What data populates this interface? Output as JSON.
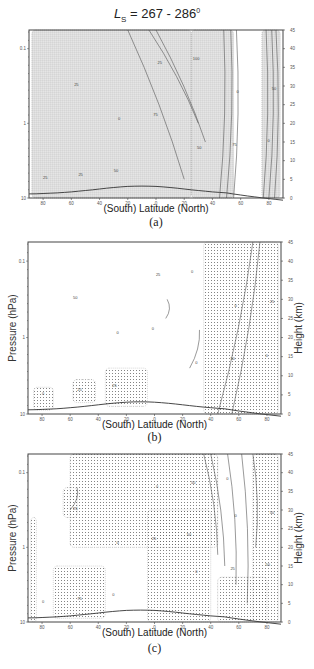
{
  "figure": {
    "title_prefix": "L",
    "title_sub": "S",
    "title_range": " = 267 - 286",
    "title_sup": "0"
  },
  "chart_data": [
    {
      "type": "heatmap",
      "panel": "(a)",
      "title": "L_S = 267 - 286°",
      "xlabel": "(South)   Latitude  (North)",
      "ylabel_left": "",
      "ylabel_right": "",
      "x_ticks": [
        "80",
        "60",
        "40",
        "20",
        "0",
        "20",
        "40",
        "60",
        "80"
      ],
      "x_range": [
        -90,
        90
      ],
      "y_ticks_left_pressure": [
        "0.1",
        "1",
        "10"
      ],
      "y_ticks_right_height_km": [
        "45",
        "40",
        "35",
        "30",
        "25",
        "20",
        "15",
        "10",
        "5",
        "0"
      ],
      "y_range_km": [
        0,
        45
      ],
      "description": "Latitude-height contour field; stippling covers most of the domain; dense contour packing at ~45-55N and ~75-85N from surface to 45 km",
      "contour_labels": [
        "25",
        "0",
        "50",
        "25",
        "0",
        "25",
        "50",
        "75",
        "100",
        "75",
        "50",
        "25",
        "0"
      ],
      "stippled_regions": [
        {
          "lat_range": [
            -88,
            25
          ],
          "height_km": [
            0,
            45
          ]
        },
        {
          "lat_range": [
            25,
            55
          ],
          "height_km": [
            0,
            45
          ]
        },
        {
          "lat_range": [
            75,
            88
          ],
          "height_km": [
            0,
            45
          ]
        }
      ]
    },
    {
      "type": "heatmap",
      "panel": "(b)",
      "xlabel": "(South)   Latitude  (North)",
      "ylabel_left": "Pressure (hPa)",
      "ylabel_right": "Height (km)",
      "x_ticks": [
        "80",
        "60",
        "40",
        "20",
        "0",
        "20",
        "40",
        "60",
        "80"
      ],
      "x_range": [
        -90,
        90
      ],
      "y_ticks_left_pressure": [
        "0.1",
        "1",
        "10"
      ],
      "y_ticks_right_height_km": [
        "45",
        "40",
        "35",
        "30",
        "25",
        "20",
        "15",
        "10",
        "5",
        "0"
      ],
      "y_range_km": [
        0,
        45
      ],
      "description": "Mostly unstippled; stippled tongue rising from ~40-85N near surface to 45 km at 60-80N; small stippled patches near surface in southern hemisphere",
      "contour_labels": [
        "0",
        "0",
        "0",
        "25",
        "0",
        "25",
        "25",
        "50",
        "0",
        "0",
        "25",
        "50",
        "0"
      ],
      "stippled_regions": [
        {
          "lat_range": [
            -86,
            -72
          ],
          "height_km": [
            1,
            7
          ]
        },
        {
          "lat_range": [
            -58,
            -42
          ],
          "height_km": [
            3,
            9
          ]
        },
        {
          "lat_range": [
            -35,
            -5
          ],
          "height_km": [
            2,
            12
          ]
        },
        {
          "lat_range": [
            35,
            88
          ],
          "height_km": [
            0,
            45
          ]
        }
      ]
    },
    {
      "type": "heatmap",
      "panel": "(c)",
      "xlabel": "(South)   Latitude  (North)",
      "ylabel_left": "Pressure (hPa)",
      "ylabel_right": "Height (km)",
      "x_ticks": [
        "80",
        "60",
        "40",
        "20",
        "0",
        "20",
        "40",
        "60",
        "80"
      ],
      "x_range": [
        -90,
        90
      ],
      "y_ticks_left_pressure": [
        "0.1",
        "1",
        "10"
      ],
      "y_ticks_right_height_km": [
        "45",
        "40",
        "35",
        "30",
        "25",
        "20",
        "15",
        "10",
        "5",
        "0"
      ],
      "y_range_km": [
        0,
        45
      ],
      "description": "Large stippled region over tropics/northern midlatitudes upper levels and northern high latitudes near surface; unstippled jet core ~50-70N",
      "contour_labels": [
        "0",
        "0",
        "0",
        "0",
        "0",
        "75",
        "50",
        "25",
        "50",
        "25",
        "0",
        "25",
        "50",
        "0",
        "50"
      ],
      "stippled_regions": [
        {
          "lat_range": [
            -60,
            45
          ],
          "height_km": [
            20,
            45
          ]
        },
        {
          "lat_range": [
            -5,
            40
          ],
          "height_km": [
            0,
            30
          ]
        },
        {
          "lat_range": [
            -72,
            -35
          ],
          "height_km": [
            1,
            15
          ]
        },
        {
          "lat_range": [
            -65,
            -55
          ],
          "height_km": [
            28,
            36
          ]
        },
        {
          "lat_range": [
            -88,
            -84
          ],
          "height_km": [
            0,
            28
          ]
        },
        {
          "lat_range": [
            70,
            88
          ],
          "height_km": [
            0,
            45
          ]
        },
        {
          "lat_range": [
            45,
            80
          ],
          "height_km": [
            0,
            12
          ]
        }
      ]
    }
  ],
  "panels": {
    "a": {
      "tag": "(a)",
      "xlabel": "(South)   Latitude  (North)"
    },
    "b": {
      "tag": "(b)",
      "xlabel": "(South)   Latitude  (North)",
      "ylabel_left": "Pressure (hPa)",
      "ylabel_right": "Height (km)"
    },
    "c": {
      "tag": "(c)",
      "xlabel": "(South)   Latitude  (North)",
      "ylabel_left": "Pressure (hPa)",
      "ylabel_right": "Height (km)"
    }
  },
  "axes": {
    "x_ticks": [
      "80",
      "60",
      "40",
      "20",
      "0",
      "20",
      "40",
      "60",
      "80"
    ],
    "p_ticks": [
      "0.1",
      "1",
      "10"
    ],
    "h_ticks": [
      "45",
      "40",
      "35",
      "30",
      "25",
      "20",
      "15",
      "10",
      "5",
      "0"
    ]
  }
}
